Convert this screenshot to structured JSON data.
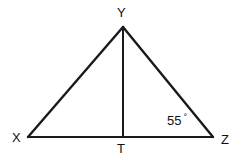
{
  "figure": {
    "kind": "geometry-diagram",
    "shape": "triangle-with-altitude",
    "background_color": "#ffffff",
    "stroke_color": "#1a1a1a",
    "text_color": "#111111"
  },
  "vertices": [
    {
      "id": "Y",
      "label": "Y",
      "x": 123,
      "y": 27,
      "label_x": 117,
      "label_y": 6
    },
    {
      "id": "X",
      "label": "X",
      "x": 28,
      "y": 137,
      "label_x": 12,
      "label_y": 131
    },
    {
      "id": "Z",
      "label": "Z",
      "x": 213,
      "y": 137,
      "label_x": 221,
      "label_y": 133
    },
    {
      "id": "T",
      "label": "T",
      "x": 123,
      "y": 137,
      "label_x": 117,
      "label_y": 142
    }
  ],
  "segments": [
    {
      "name": "side-XY",
      "from": "X",
      "to": "Y",
      "x1": 28,
      "y1": 137,
      "x2": 123,
      "y2": 27,
      "width": 2.4
    },
    {
      "name": "side-YZ",
      "from": "Y",
      "to": "Z",
      "x1": 123,
      "y1": 27,
      "x2": 213,
      "y2": 137,
      "width": 2.4
    },
    {
      "name": "side-XZ",
      "from": "X",
      "to": "Z",
      "x1": 28,
      "y1": 137,
      "x2": 213,
      "y2": 137,
      "width": 2.0
    },
    {
      "name": "altitude-YT",
      "from": "Y",
      "to": "T",
      "x1": 123,
      "y1": 27,
      "x2": 123,
      "y2": 137,
      "width": 2.0
    }
  ],
  "angles": [
    {
      "name": "angle-at-Z",
      "at_vertex": "Z",
      "value": "55",
      "degree_symbol": "°",
      "label_x": 167,
      "label_y": 113
    }
  ]
}
